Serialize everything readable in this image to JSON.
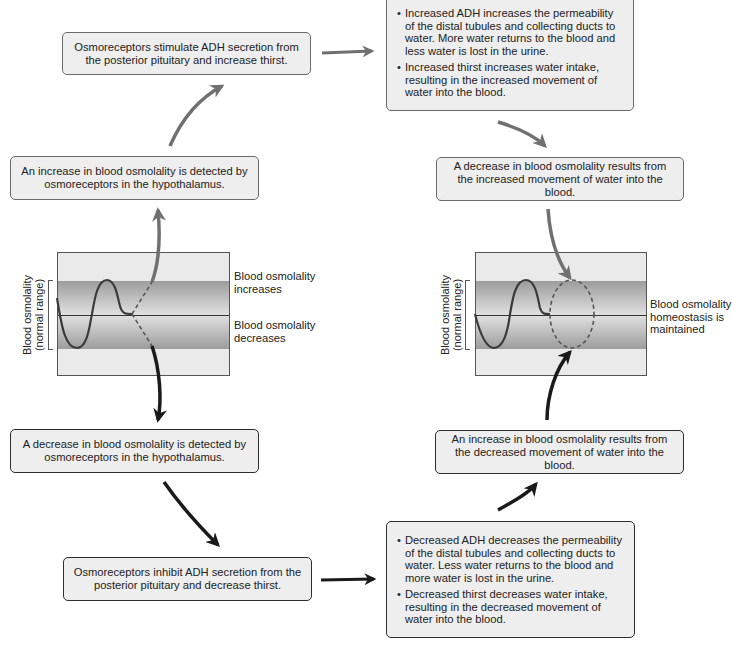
{
  "diagram": {
    "title_visible": false,
    "colors": {
      "box_fill": "#eeeeee",
      "box_border_light": "#6a6a6a",
      "box_border_dark": "#2e2e2e",
      "arrow_gray": "#707070",
      "arrow_dark": "#1a1a1a",
      "band_dark": "#9c9c9c",
      "band_light": "#dedede",
      "graph_bg": "#eaeaea"
    },
    "increase_path": {
      "detect_box": "An increase in blood osmolality is detected by osmoreceptors in the hypothalamus.",
      "response_box": "Osmoreceptors stimulate ADH secretion from the posterior pituitary and increase thirst.",
      "effects": [
        "Increased ADH increases the permeability of the distal tubules and collecting ducts to water. More water returns to the blood and less water is lost in the urine.",
        "Increased thirst increases water intake, resulting in the increased movement of water into the blood."
      ],
      "result_box": "A decrease in blood osmolality results from the increased movement of water into the blood."
    },
    "decrease_path": {
      "detect_box": "A decrease in blood osmolality is detected by osmoreceptors in the hypothalamus.",
      "response_box": "Osmoreceptors inhibit ADH secretion from the posterior pituitary and decrease thirst.",
      "effects": [
        "Decreased ADH decreases the permeability of the distal tubules and collecting ducts to water. Less water returns to the blood and more water is lost in the urine.",
        "Decreased thirst decreases water intake, resulting in the decreased movement of water into the blood."
      ],
      "result_box": "An increase in blood osmolality results from the decreased movement of water into the blood."
    },
    "left_graph": {
      "y_label_line1": "Blood osmolality",
      "y_label_line2": "(normal range)",
      "label_up_line1": "Blood osmolality",
      "label_up_line2": "increases",
      "label_down_line1": "Blood osmolality",
      "label_down_line2": "decreases"
    },
    "right_graph": {
      "y_label_line1": "Blood osmolality",
      "y_label_line2": "(normal range)",
      "label_line1": "Blood osmolality",
      "label_line2": "homeostasis is",
      "label_line3": "maintained"
    }
  }
}
